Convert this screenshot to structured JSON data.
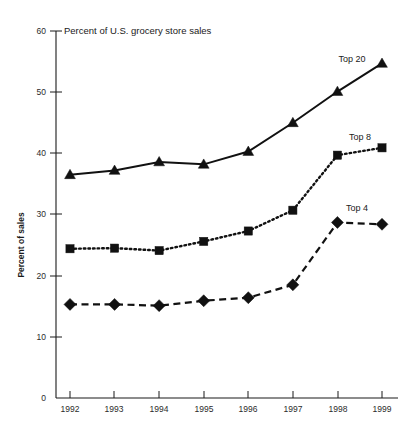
{
  "chart_data": {
    "type": "line",
    "title": "Percent of U.S. grocery store sales",
    "xlabel": "",
    "ylabel": "Percent of sales",
    "x": [
      1992,
      1993,
      1994,
      1995,
      1996,
      1997,
      1998,
      1999
    ],
    "categories": [
      "1992",
      "1993",
      "1994",
      "1995",
      "1996",
      "1997",
      "1998",
      "1999"
    ],
    "xlim": [
      1992,
      1999
    ],
    "ylim": [
      0,
      60
    ],
    "yticks": [
      0,
      10,
      20,
      30,
      40,
      50,
      60
    ],
    "ytick_labels": [
      "0",
      "10",
      "20",
      "30",
      "40",
      "50",
      "60"
    ],
    "xticks": [
      1992,
      1993,
      1994,
      1995,
      1996,
      1997,
      1998,
      1999
    ],
    "grid": false,
    "legend_position": "inline-end-of-line",
    "series": [
      {
        "name": "Top 20",
        "label": "Top 20",
        "marker": "triangle",
        "linestyle": "solid",
        "color": "#111111",
        "values": [
          36.5,
          37.2,
          38.6,
          38.2,
          40.3,
          45.0,
          50.1,
          54.7
        ]
      },
      {
        "name": "Top 8",
        "label": "Top 8",
        "marker": "square",
        "linestyle": "dotted",
        "color": "#111111",
        "values": [
          24.4,
          24.5,
          24.1,
          25.6,
          27.3,
          30.7,
          39.7,
          40.9
        ]
      },
      {
        "name": "Top 4",
        "label": "Top 4",
        "marker": "diamond",
        "linestyle": "dashed",
        "color": "#111111",
        "values": [
          15.3,
          15.3,
          15.1,
          15.9,
          16.4,
          18.5,
          28.7,
          28.4
        ]
      }
    ]
  },
  "colors": {
    "background": "#ffffff",
    "ink": "#111111",
    "axis": "#1a1a1a"
  }
}
